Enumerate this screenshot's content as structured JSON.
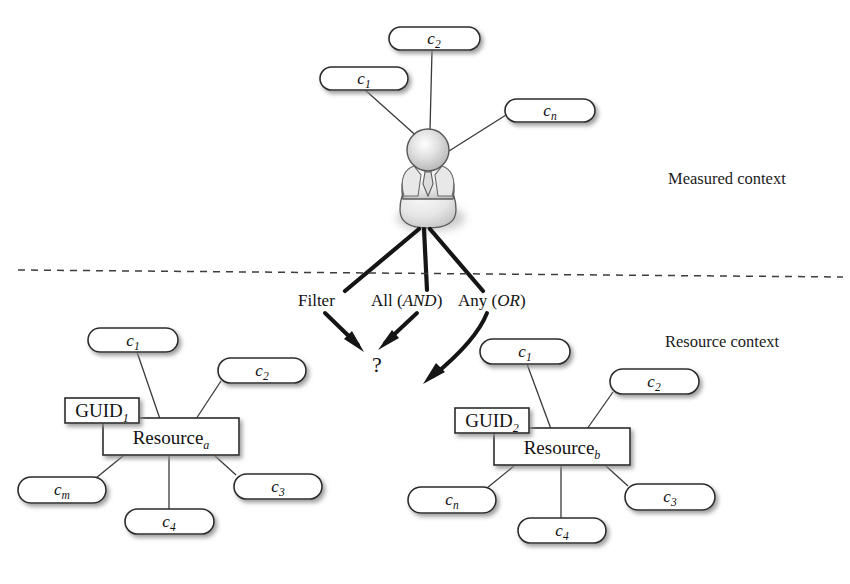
{
  "diagram": {
    "background_color": "#ffffff",
    "line_color": "#2a2a2a"
  },
  "sections": {
    "measured_label": "Measured context",
    "resource_label": "Resource context"
  },
  "person": {
    "icon_name": "person-avatar-icon",
    "head_color": "#d9d9d9",
    "body_color": "#ededed"
  },
  "measured_nodes": [
    {
      "id": "m-c1",
      "base": "c",
      "sub": "1",
      "x": 320,
      "y": 67,
      "w": 88,
      "h": 23
    },
    {
      "id": "m-c2",
      "base": "c",
      "sub": "2",
      "x": 389,
      "y": 27,
      "w": 91,
      "h": 23
    },
    {
      "id": "m-cn",
      "base": "c",
      "sub": "n",
      "x": 505,
      "y": 99,
      "w": 90,
      "h": 23
    }
  ],
  "operators": {
    "filter": "Filter",
    "all_prefix": "All (",
    "all_italic": "AND",
    "all_suffix": ")",
    "any_prefix": "Any (",
    "any_italic": "OR",
    "any_suffix": ")",
    "unknown": "?"
  },
  "resource_a": {
    "guid_label": "GUID",
    "guid_sub": "1",
    "resource_label": "Resource",
    "resource_sub": "a",
    "guid_box": {
      "x": 65,
      "y": 398,
      "w": 74,
      "h": 25
    },
    "resource_box": {
      "x": 103,
      "y": 418,
      "w": 136,
      "h": 37
    },
    "nodes": [
      {
        "id": "a-c1",
        "base": "c",
        "sub": "1",
        "x": 88,
        "y": 328,
        "w": 90,
        "h": 24
      },
      {
        "id": "a-c2",
        "base": "c",
        "sub": "2",
        "x": 218,
        "y": 358,
        "w": 88,
        "h": 25
      },
      {
        "id": "a-c3",
        "base": "c",
        "sub": "3",
        "x": 234,
        "y": 474,
        "w": 88,
        "h": 25
      },
      {
        "id": "a-c4",
        "base": "c",
        "sub": "4",
        "x": 125,
        "y": 509,
        "w": 89,
        "h": 25
      },
      {
        "id": "a-cm",
        "base": "c",
        "sub": "m",
        "x": 18,
        "y": 477,
        "w": 88,
        "h": 26
      }
    ]
  },
  "resource_b": {
    "guid_label": "GUID",
    "guid_sub": "2",
    "resource_label": "Resource",
    "resource_sub": "b",
    "guid_box": {
      "x": 455,
      "y": 408,
      "w": 74,
      "h": 25
    },
    "resource_box": {
      "x": 494,
      "y": 428,
      "w": 136,
      "h": 37
    },
    "nodes": [
      {
        "id": "b-c1",
        "base": "c",
        "sub": "1",
        "x": 480,
        "y": 339,
        "w": 90,
        "h": 25
      },
      {
        "id": "b-c2",
        "base": "c",
        "sub": "2",
        "x": 610,
        "y": 369,
        "w": 89,
        "h": 25
      },
      {
        "id": "b-c3",
        "base": "c",
        "sub": "3",
        "x": 625,
        "y": 484,
        "w": 90,
        "h": 26
      },
      {
        "id": "b-c4",
        "base": "c",
        "sub": "4",
        "x": 518,
        "y": 518,
        "w": 88,
        "h": 25
      },
      {
        "id": "b-cn",
        "base": "c",
        "sub": "n",
        "x": 408,
        "y": 487,
        "w": 88,
        "h": 26
      }
    ]
  }
}
